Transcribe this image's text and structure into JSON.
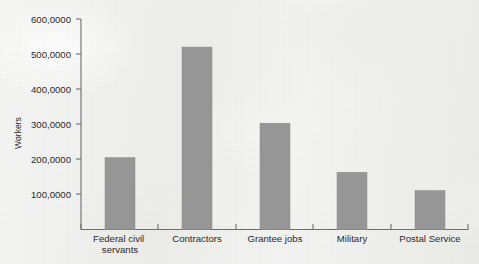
{
  "chart_data": {
    "type": "bar",
    "title": "",
    "subtitle": "",
    "xlabel": "",
    "ylabel": "Workers",
    "categories": [
      "Federal civil servants",
      "Contractors",
      "Grantee jobs",
      "Military",
      "Postal Service"
    ],
    "category_lines": [
      [
        "Federal civil",
        "servants"
      ],
      [
        "Contractors"
      ],
      [
        "Grantee jobs"
      ],
      [
        "Military"
      ],
      [
        "Postal Service"
      ]
    ],
    "values": [
      205000,
      520000,
      303000,
      163000,
      111000
    ],
    "ylim": [
      0,
      600000
    ],
    "yticks": [
      100000,
      200000,
      300000,
      400000,
      500000,
      600000
    ],
    "ytick_labels": [
      "100,0000",
      "200,0000",
      "300,0000",
      "400,0000",
      "500,0000",
      "600,0000"
    ],
    "grid": false,
    "legend": null,
    "bar_color": "#969696",
    "axis_color": "#6d6d6d",
    "background_color": "#f2f2f0"
  }
}
